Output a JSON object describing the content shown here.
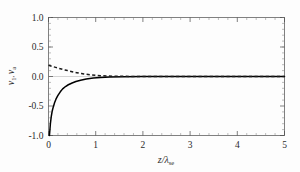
{
  "chart_data": {
    "type": "line",
    "title": "",
    "subtitle": "",
    "xlabel": "z/λ",
    "xlabel_main": "z/λ",
    "xlabel_sub": "se",
    "ylabel": "v₁, vₐ",
    "ylabel_main": "v",
    "ylabel_sub1": "1",
    "ylabel_main2": "v",
    "ylabel_sub2": "a",
    "xlim": [
      0,
      5
    ],
    "ylim": [
      -1.0,
      1.0
    ],
    "xticks": [
      0,
      1,
      2,
      3,
      4,
      5
    ],
    "xtick_labels": [
      "0",
      "1",
      "2",
      "3",
      "4",
      "5"
    ],
    "yticks": [
      -1.0,
      -0.5,
      0.0,
      0.5,
      1.0
    ],
    "ytick_labels": [
      "-1.0",
      "-0.5",
      "0.0",
      "0.5",
      "1.0"
    ],
    "grid": false,
    "legend": "none",
    "zero_reference_line": true,
    "frame": true,
    "series": [
      {
        "name": "v_1",
        "style": "solid",
        "color": "#000000",
        "x": [
          0.02,
          0.04,
          0.06,
          0.08,
          0.1,
          0.13,
          0.16,
          0.2,
          0.25,
          0.3,
          0.36,
          0.42,
          0.5,
          0.58,
          0.68,
          0.8,
          0.95,
          1.1,
          1.3,
          1.6,
          2.0,
          2.5,
          3.0,
          3.5,
          4.0,
          4.5,
          5.0
        ],
        "y": [
          -1.0,
          -0.8,
          -0.67,
          -0.58,
          -0.52,
          -0.44,
          -0.38,
          -0.32,
          -0.26,
          -0.21,
          -0.17,
          -0.14,
          -0.11,
          -0.085,
          -0.062,
          -0.042,
          -0.026,
          -0.017,
          -0.01,
          -0.005,
          -0.002,
          -0.001,
          0.0,
          0.0,
          0.0,
          0.0,
          0.0
        ]
      },
      {
        "name": "v_a",
        "style": "dashed",
        "color": "#1a1a1a",
        "x": [
          0.0,
          0.05,
          0.1,
          0.15,
          0.2,
          0.25,
          0.3,
          0.35,
          0.4,
          0.45,
          0.5,
          0.55,
          0.6,
          0.65,
          0.7,
          0.75,
          0.8,
          0.9,
          1.0,
          1.1,
          1.25,
          1.5,
          1.8,
          2.2,
          2.6,
          3.0,
          3.5,
          4.0,
          4.5,
          5.0
        ],
        "y": [
          0.19,
          0.178,
          0.166,
          0.155,
          0.143,
          0.132,
          0.121,
          0.111,
          0.101,
          0.091,
          0.082,
          0.073,
          0.065,
          0.057,
          0.05,
          0.043,
          0.037,
          0.027,
          0.019,
          0.013,
          0.008,
          0.003,
          0.001,
          0.0,
          0.0,
          0.0,
          0.0,
          0.0,
          0.0,
          0.0
        ]
      }
    ]
  }
}
